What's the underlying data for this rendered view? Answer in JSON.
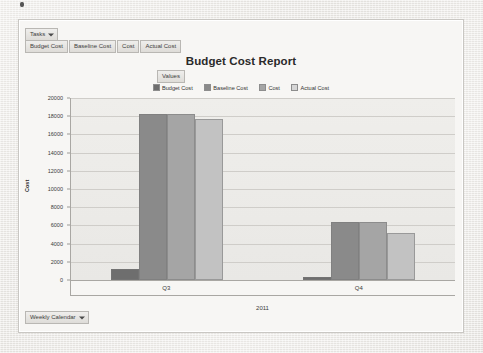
{
  "window": {
    "background_color": "#eceae6",
    "panel_background": "#f7f6f4",
    "border_color": "#c9c7c3"
  },
  "toolbar": {
    "tasks_dropdown_label": "Tasks",
    "field_buttons": [
      {
        "label": "Budget Cost"
      },
      {
        "label": "Baseline Cost"
      },
      {
        "label": "Cost"
      },
      {
        "label": "Actual Cost"
      }
    ]
  },
  "values_chip": {
    "label": "Values"
  },
  "footer": {
    "calendar_dropdown_label": "Weekly Calendar"
  },
  "chart_data": {
    "type": "bar",
    "title": "Budget Cost Report",
    "xlabel": "2011",
    "ylabel": "Cost",
    "categories": [
      "Q3",
      "Q4"
    ],
    "ylim": [
      0,
      20000
    ],
    "yticks": [
      0,
      2000,
      4000,
      6000,
      8000,
      10000,
      12000,
      14000,
      16000,
      18000,
      20000
    ],
    "grid": true,
    "legend_position": "top",
    "series": [
      {
        "name": "Budget Cost",
        "color": "#6e6e6e",
        "values": [
          1000,
          120
        ]
      },
      {
        "name": "Baseline Cost",
        "color": "#8a8a8a",
        "values": [
          18000,
          6200
        ]
      },
      {
        "name": "Cost",
        "color": "#a5a5a5",
        "values": [
          18000,
          6200
        ]
      },
      {
        "name": "Actual Cost",
        "color": "#c2c2c2",
        "values": [
          17500,
          5000
        ]
      }
    ]
  }
}
